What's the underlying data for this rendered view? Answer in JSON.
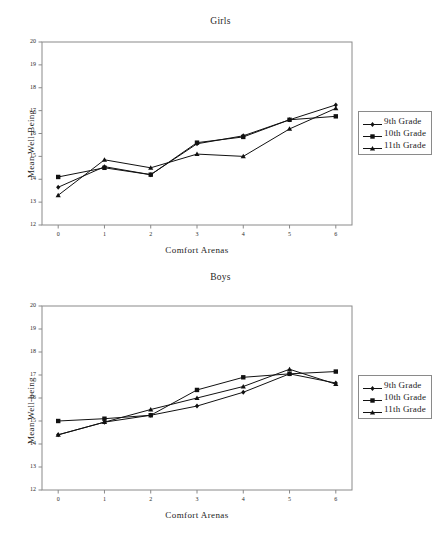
{
  "page": {
    "background": "#ffffff",
    "axis_color": "#8a8a8a",
    "series_color": "#111111"
  },
  "legend": {
    "entries": [
      {
        "label": "9th Grade",
        "marker": "diamond",
        "color": "#111111"
      },
      {
        "label": "10th Grade",
        "marker": "square",
        "color": "#111111"
      },
      {
        "label": "11th Grade",
        "marker": "triangle",
        "color": "#111111"
      }
    ]
  },
  "chart_data": [
    {
      "id": "girls",
      "type": "line",
      "title": "Girls",
      "xlabel": "Comfort Arenas",
      "ylabel": "Mean Well-Being",
      "x": [
        0,
        1,
        2,
        3,
        4,
        5,
        6
      ],
      "xticklabels": [
        "0",
        "1",
        "2",
        "3",
        "4",
        "5",
        "6"
      ],
      "yticks": [
        12,
        13,
        14,
        15,
        16,
        17,
        18,
        19,
        20
      ],
      "yticklabels": [
        "12",
        "13",
        "14",
        "15",
        "16",
        "17",
        "18",
        "19",
        "20"
      ],
      "xlim": [
        -0.35,
        6.35
      ],
      "ylim": [
        12,
        20
      ],
      "grid": false,
      "legend_position": "right",
      "series": [
        {
          "name": "9th Grade",
          "marker": "diamond",
          "values": [
            13.65,
            14.55,
            14.2,
            15.55,
            15.9,
            16.6,
            17.25
          ]
        },
        {
          "name": "10th Grade",
          "marker": "square",
          "values": [
            14.1,
            14.5,
            14.2,
            15.6,
            15.85,
            16.6,
            16.75
          ]
        },
        {
          "name": "11th Grade",
          "marker": "triangle",
          "values": [
            13.3,
            14.85,
            14.5,
            15.1,
            15.0,
            16.2,
            17.1
          ]
        }
      ]
    },
    {
      "id": "boys",
      "type": "line",
      "title": "Boys",
      "xlabel": "Comfort Arenas",
      "ylabel": "Mean Well-being",
      "x": [
        0,
        1,
        2,
        3,
        4,
        5,
        6
      ],
      "xticklabels": [
        "0",
        "1",
        "2",
        "3",
        "4",
        "5",
        "6"
      ],
      "yticks": [
        12,
        13,
        14,
        15,
        16,
        17,
        18,
        19,
        20
      ],
      "yticklabels": [
        "12",
        "13",
        "14",
        "15",
        "16",
        "17",
        "18",
        "19",
        "20"
      ],
      "xlim": [
        -0.35,
        6.35
      ],
      "ylim": [
        12,
        20
      ],
      "grid": false,
      "legend_position": "right",
      "series": [
        {
          "name": "9th Grade",
          "marker": "diamond",
          "values": [
            14.4,
            14.95,
            15.25,
            15.65,
            16.25,
            17.05,
            16.65
          ]
        },
        {
          "name": "10th Grade",
          "marker": "square",
          "values": [
            15.0,
            15.1,
            15.25,
            16.35,
            16.9,
            17.05,
            17.15
          ]
        },
        {
          "name": "11th Grade",
          "marker": "triangle",
          "values": [
            14.4,
            14.95,
            15.5,
            16.0,
            16.5,
            17.25,
            16.6
          ]
        }
      ]
    }
  ]
}
